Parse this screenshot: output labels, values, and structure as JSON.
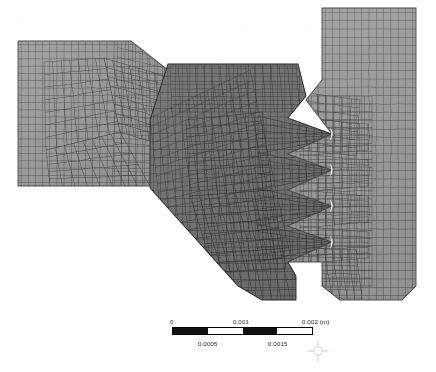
{
  "view": {
    "title": "Finite element mesh of interlocking dovetail joint",
    "background_color": "#ffffff",
    "width": 436,
    "height": 372
  },
  "mesh": {
    "description": "Quadrilateral finite element mesh, three contacting bodies forming a sawtooth / dovetail interlock",
    "edge_color": "#3a3a3a",
    "bodies": [
      {
        "name": "left-arm",
        "fill_color": "#9a9a9a",
        "edge_color": "#434343",
        "note": "Light gray tapered arm entering from the left edge"
      },
      {
        "name": "central-body",
        "fill_color": "#6f6f6f",
        "edge_color": "#2e2e2e",
        "note": "Dark gray central polygon with four saw teeth on its right flank"
      },
      {
        "name": "right-block",
        "fill_color": "#9a9a9a",
        "edge_color": "#434343",
        "note": "Light gray rectangular block on the right with mating tooth sockets"
      }
    ],
    "contact_gaps": {
      "name": "tooth-root-gaps",
      "color": "#ffffff",
      "count": 4,
      "note": "White crescent clearances at each tooth root of the interlock"
    }
  },
  "scalebar": {
    "name": "scale-bar",
    "unit": "(m)",
    "segments": 4,
    "segment_colors": [
      "#111111",
      "#ffffff",
      "#111111",
      "#ffffff"
    ],
    "labels_top": [
      "0",
      "0.001",
      "0.002 (m)"
    ],
    "labels_bottom": [
      "0.0005",
      "0.0015"
    ],
    "label_color": "#2a2a2a",
    "range_min": 0,
    "range_max": 0.002
  },
  "triad": {
    "name": "coordinate-triad",
    "color": "#9b9b9b",
    "note": "Faint crosshair axis indicator at lower right of scale bar"
  }
}
